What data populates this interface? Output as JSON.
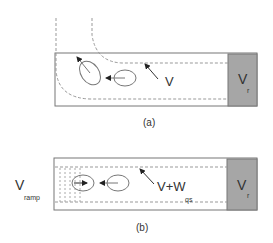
{
  "panel_a": {
    "caption": "(a)",
    "flow_label": "V",
    "wall_label": "V",
    "wall_subscript": "r"
  },
  "panel_b": {
    "caption": "(b)",
    "ramp_label": "V",
    "ramp_subscript": "ramp",
    "flow_label": "V+W",
    "flow_subscript": "qs",
    "wall_label": "V",
    "wall_subscript": "r"
  },
  "colors": {
    "outline": "#777777",
    "dashed": "#999999",
    "wall_fill": "#a6a6a6",
    "text": "#333333"
  }
}
